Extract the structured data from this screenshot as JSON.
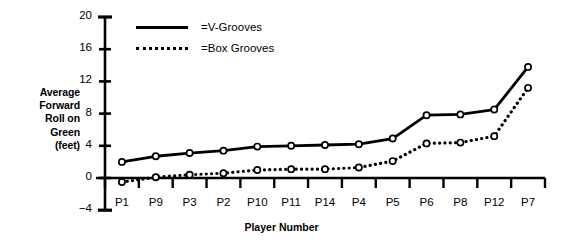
{
  "chart_data": {
    "type": "line",
    "title": "",
    "subtitle": "",
    "xlabel": "Player Number",
    "ylabel": "Average Forward Roll on Green (feet)",
    "ylabel_lines": [
      "Average",
      "Forward",
      "Roll on",
      "Green",
      "(feet)"
    ],
    "categories": [
      "P1",
      "P9",
      "P3",
      "P2",
      "P10",
      "P11",
      "P14",
      "P4",
      "P5",
      "P6",
      "P8",
      "P12",
      "P7"
    ],
    "ylim": [
      -4,
      20
    ],
    "yticks": [
      -4,
      0,
      4,
      8,
      12,
      16,
      20
    ],
    "ytick_labels": [
      "−4",
      "0",
      "4",
      "8",
      "12",
      "16",
      "20"
    ],
    "grid": false,
    "legend_position": "top-left-inside",
    "zero_line": true,
    "marker": "open-circle",
    "series": [
      {
        "name": "=V-Grooves",
        "legend_label": "=V-Grooves",
        "style": "solid",
        "color": "#000000",
        "values": [
          2.0,
          2.7,
          3.1,
          3.4,
          3.9,
          4.0,
          4.1,
          4.2,
          4.9,
          7.8,
          7.9,
          8.5,
          13.8
        ]
      },
      {
        "name": "=Box Grooves",
        "legend_label": "=Box Grooves",
        "style": "dotted",
        "color": "#000000",
        "values": [
          -0.5,
          0.1,
          0.4,
          0.6,
          1.0,
          1.1,
          1.1,
          1.3,
          2.1,
          4.3,
          4.4,
          5.2,
          11.2
        ]
      }
    ]
  },
  "axis": {
    "x_label": "Player Number"
  }
}
